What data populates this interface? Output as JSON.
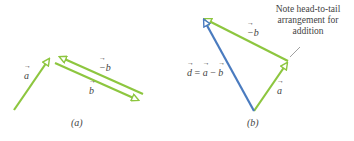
{
  "panels": [
    {
      "id": "a",
      "caption": "(a)",
      "vectors": [
        {
          "name": "a",
          "label": "a",
          "color": "#8dc63f"
        },
        {
          "name": "minus-b",
          "label": "−b",
          "color": "#8dc63f"
        },
        {
          "name": "b",
          "label": "b",
          "color": "#8dc63f"
        }
      ]
    },
    {
      "id": "b",
      "caption": "(b)",
      "vectors": [
        {
          "name": "minus-b",
          "label": "−b",
          "color": "#8dc63f"
        },
        {
          "name": "a",
          "label": "a",
          "color": "#8dc63f"
        },
        {
          "name": "d",
          "label_parts": [
            "d",
            " = ",
            "a",
            " − ",
            "b"
          ],
          "color": "#4a7bbf"
        }
      ],
      "note": "Note head-to-tail arrangement for addition"
    }
  ],
  "colors": {
    "green": "#8dc63f",
    "blue": "#4a7bbf"
  }
}
